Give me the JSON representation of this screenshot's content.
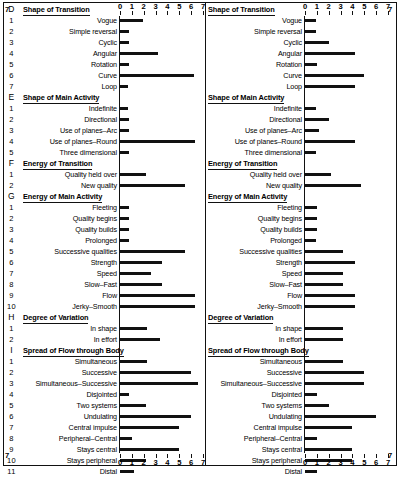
{
  "figure": {
    "axis": {
      "ticks": [
        "0",
        "1",
        "2",
        "3",
        "4",
        "5",
        "6",
        "7"
      ],
      "min": 0,
      "max": 7
    },
    "edge_marks": {
      "left_top": "7",
      "left_bottom": "7",
      "right_top": "7",
      "right_bottom": "7"
    }
  },
  "chart_data": {
    "type": "bar",
    "title": "",
    "xlabel": "",
    "ylabel": "",
    "xlim": [
      0,
      7
    ],
    "grid": false,
    "legend_position": "none",
    "orientation": "horizontal",
    "panels": [
      {
        "name": "left-panel",
        "sections": [
          {
            "letter": "D",
            "header": "Shape of Transition",
            "items": [
              {
                "index": "1",
                "label": "Vogue",
                "value": 1.9
              },
              {
                "index": "2",
                "label": "Simple reversal",
                "value": 0.8
              },
              {
                "index": "3",
                "label": "Cyclic",
                "value": 0.8
              },
              {
                "index": "4",
                "label": "Angular",
                "value": 3.2
              },
              {
                "index": "5",
                "label": "Rotation",
                "value": 0.8
              },
              {
                "index": "6",
                "label": "Curve",
                "value": 6.2
              },
              {
                "index": "7",
                "label": "Loop",
                "value": 0.7
              }
            ]
          },
          {
            "letter": "E",
            "header": "Shape of Main Activity",
            "items": [
              {
                "index": "1",
                "label": "Indefinite",
                "value": 0.7
              },
              {
                "index": "2",
                "label": "Directional",
                "value": 0.8
              },
              {
                "index": "3",
                "label": "Use of planes–Arc",
                "value": 0.8
              },
              {
                "index": "4",
                "label": "Use of planes–Round",
                "value": 6.3
              },
              {
                "index": "5",
                "label": "Three dimensional",
                "value": 0.8
              }
            ]
          },
          {
            "letter": "F",
            "header": "Energy of Transition",
            "items": [
              {
                "index": "1",
                "label": "Quality held over",
                "value": 2.2
              },
              {
                "index": "2",
                "label": "New quality",
                "value": 5.5
              }
            ]
          },
          {
            "letter": "G",
            "header": "Energy of Main Activity",
            "items": [
              {
                "index": "1",
                "label": "Fleeting",
                "value": 0.8
              },
              {
                "index": "2",
                "label": "Quality begins",
                "value": 0.8
              },
              {
                "index": "3",
                "label": "Quality builds",
                "value": 0.8
              },
              {
                "index": "4",
                "label": "Prolonged",
                "value": 0.8
              },
              {
                "index": "5",
                "label": "Successive qualities",
                "value": 5.5
              },
              {
                "index": "6",
                "label": "Strength",
                "value": 3.5
              },
              {
                "index": "7",
                "label": "Speed",
                "value": 2.6
              },
              {
                "index": "8",
                "label": "Slow–Fast",
                "value": 3.5
              },
              {
                "index": "9",
                "label": "Flow",
                "value": 6.3
              },
              {
                "index": "10",
                "label": "Jerky–Smooth",
                "value": 6.3
              }
            ]
          },
          {
            "letter": "H",
            "header": "Degree of Variation",
            "items": [
              {
                "index": "1",
                "label": "In shape",
                "value": 2.3
              },
              {
                "index": "2",
                "label": "In effort",
                "value": 3.4
              }
            ]
          },
          {
            "letter": "I",
            "header": "Spread of Flow through Body",
            "items": [
              {
                "index": "1",
                "label": "Simultaneous",
                "value": 2.3
              },
              {
                "index": "2",
                "label": "Successive",
                "value": 6.0
              },
              {
                "index": "3",
                "label": "Simultaneous–Successive",
                "value": 6.6
              },
              {
                "index": "4",
                "label": "Disjointed",
                "value": 0.8
              },
              {
                "index": "5",
                "label": "Two systems",
                "value": 2.2
              },
              {
                "index": "6",
                "label": "Undulating",
                "value": 6.0
              },
              {
                "index": "7",
                "label": "Central impulse",
                "value": 5.0
              },
              {
                "index": "8",
                "label": "Peripheral–Central",
                "value": 1.0
              },
              {
                "index": "9",
                "label": "Stays central",
                "value": 5.0
              },
              {
                "index": "10",
                "label": "Stays peripheral",
                "value": 2.2
              },
              {
                "index": "11",
                "label": "Distal",
                "value": 1.2
              }
            ]
          }
        ]
      },
      {
        "name": "right-panel",
        "sections": [
          {
            "letter": "",
            "header": "Shape of Transition",
            "items": [
              {
                "index": "",
                "label": "Vogue",
                "value": 0.9
              },
              {
                "index": "",
                "label": "Simple reversal",
                "value": 0.9
              },
              {
                "index": "",
                "label": "Cyclic",
                "value": 2.0
              },
              {
                "index": "",
                "label": "Angular",
                "value": 4.2
              },
              {
                "index": "",
                "label": "Rotation",
                "value": 1.0
              },
              {
                "index": "",
                "label": "Curve",
                "value": 5.0
              },
              {
                "index": "",
                "label": "Loop",
                "value": 4.2
              }
            ]
          },
          {
            "letter": "",
            "header": "Shape of Main Activity",
            "items": [
              {
                "index": "",
                "label": "Indefinite",
                "value": 0.9
              },
              {
                "index": "",
                "label": "Directional",
                "value": 2.0
              },
              {
                "index": "",
                "label": "Use of planes–Arc",
                "value": 1.2
              },
              {
                "index": "",
                "label": "Use of planes–Round",
                "value": 4.2
              },
              {
                "index": "",
                "label": "Three dimensional",
                "value": 0.9
              }
            ]
          },
          {
            "letter": "",
            "header": "Energy of Transition",
            "items": [
              {
                "index": "",
                "label": "Quality held over",
                "value": 2.2
              },
              {
                "index": "",
                "label": "New quality",
                "value": 4.7
              }
            ]
          },
          {
            "letter": "",
            "header": "Energy of Main Activity",
            "items": [
              {
                "index": "",
                "label": "Fleeting",
                "value": 1.0
              },
              {
                "index": "",
                "label": "Quality begins",
                "value": 1.0
              },
              {
                "index": "",
                "label": "Quality builds",
                "value": 1.0
              },
              {
                "index": "",
                "label": "Prolonged",
                "value": 0.9
              },
              {
                "index": "",
                "label": "Successive qualities",
                "value": 3.2
              },
              {
                "index": "",
                "label": "Strength",
                "value": 4.2
              },
              {
                "index": "",
                "label": "Speed",
                "value": 3.2
              },
              {
                "index": "",
                "label": "Slow–Fast",
                "value": 3.2
              },
              {
                "index": "",
                "label": "Flow",
                "value": 4.2
              },
              {
                "index": "",
                "label": "Jerky–Smooth",
                "value": 4.2
              }
            ]
          },
          {
            "letter": "",
            "header": "Degree of Variation",
            "items": [
              {
                "index": "",
                "label": "In shape",
                "value": 3.2
              },
              {
                "index": "",
                "label": "In effort",
                "value": 3.2
              }
            ]
          },
          {
            "letter": "",
            "header": "Spread of Flow through Body",
            "items": [
              {
                "index": "",
                "label": "Simultaneous",
                "value": 3.2
              },
              {
                "index": "",
                "label": "Successive",
                "value": 5.0
              },
              {
                "index": "",
                "label": "Simultaneous–Successive",
                "value": 5.0
              },
              {
                "index": "",
                "label": "Disjointed",
                "value": 1.0
              },
              {
                "index": "",
                "label": "Two systems",
                "value": 2.0
              },
              {
                "index": "",
                "label": "Undulating",
                "value": 6.0
              },
              {
                "index": "",
                "label": "Central impulse",
                "value": 4.0
              },
              {
                "index": "",
                "label": "Peripheral–Central",
                "value": 1.0
              },
              {
                "index": "",
                "label": "Stays central",
                "value": 4.0
              },
              {
                "index": "",
                "label": "Stays peripheral",
                "value": 4.0
              },
              {
                "index": "",
                "label": "Distal",
                "value": 1.0
              }
            ]
          }
        ]
      }
    ]
  }
}
